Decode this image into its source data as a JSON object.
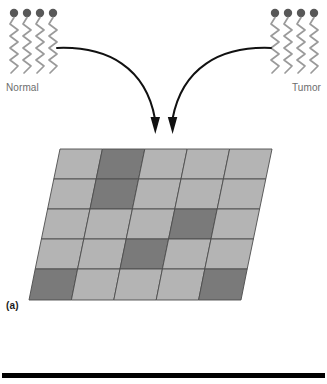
{
  "figure": {
    "panel_label": "(a)",
    "samples": [
      {
        "id": "normal",
        "label": "Normal",
        "strand_count": 4,
        "cap_color": "#585858",
        "strand_color": "#9a9a9a",
        "label_color": "#6d6d6d"
      },
      {
        "id": "tumor",
        "label": "Tumor",
        "strand_count": 4,
        "cap_color": "#585858",
        "strand_color": "#9a9a9a",
        "label_color": "#6d6d6d"
      }
    ],
    "arrows": [
      {
        "name": "arrow-normal-to-array",
        "from": "normal",
        "to": "microarray",
        "color": "#111111"
      },
      {
        "name": "arrow-tumor-to-array",
        "from": "tumor",
        "to": "microarray",
        "color": "#111111"
      }
    ],
    "microarray": {
      "rows": 5,
      "cols": 5,
      "light_color": "#b4b4b4",
      "dark_color": "#7a7a7a",
      "border_color": "#4d4d4d",
      "cells": [
        [
          "light",
          "dark",
          "light",
          "light",
          "light"
        ],
        [
          "light",
          "dark",
          "light",
          "light",
          "light"
        ],
        [
          "light",
          "light",
          "light",
          "dark",
          "light"
        ],
        [
          "light",
          "light",
          "dark",
          "light",
          "light"
        ],
        [
          "dark",
          "light",
          "light",
          "light",
          "dark"
        ]
      ]
    },
    "bottom_rule_color": "#000000"
  }
}
